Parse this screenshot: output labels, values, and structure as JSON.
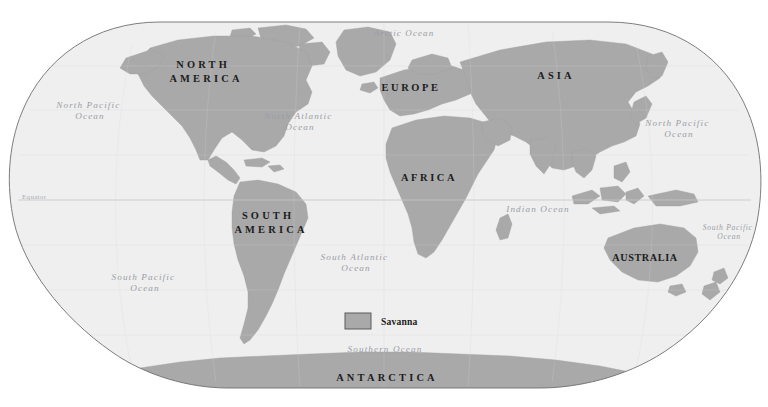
{
  "map": {
    "projection": "Robinson",
    "title_visible": false,
    "colors": {
      "background": "#ffffff",
      "ocean": "#efefef",
      "land": "#a9a9a9",
      "land_stroke": "#9d9d9d",
      "frame_stroke": "#6d6d6d",
      "antarctica": "#a9a9a9",
      "ocean_label": "#9a9ea6",
      "continent_label": "#1c1c1c",
      "graticule": "#cfcfcf",
      "legend_swatch": "#a9a9a9",
      "legend_swatch_border": "#5a5a5a"
    },
    "continents": [
      {
        "id": "north-america",
        "label": "NORTH AMERICA",
        "lines": [
          "NORTH",
          "AMERICA"
        ],
        "x": 206,
        "y": 69,
        "style": "wide"
      },
      {
        "id": "south-america",
        "label": "SOUTH AMERICA",
        "lines": [
          "SOUTH",
          "AMERICA"
        ],
        "x": 271,
        "y": 220,
        "style": "wide"
      },
      {
        "id": "europe",
        "label": "EUROPE",
        "lines": [
          "EUROPE"
        ],
        "x": 411,
        "y": 88,
        "style": "normal"
      },
      {
        "id": "africa",
        "label": "AFRICA",
        "lines": [
          "AFRICA"
        ],
        "x": 429,
        "y": 178,
        "style": "normal"
      },
      {
        "id": "asia",
        "label": "ASIA",
        "lines": [
          "ASIA"
        ],
        "x": 556,
        "y": 76,
        "style": "normal"
      },
      {
        "id": "australia",
        "label": "AUSTRALIA",
        "lines": [
          "AUSTRALIA"
        ],
        "x": 645,
        "y": 258,
        "style": "tight"
      },
      {
        "id": "antarctica",
        "label": "ANTARCTICA",
        "lines": [
          "ANTARCTICA"
        ],
        "x": 387,
        "y": 379,
        "style": "wide"
      }
    ],
    "oceans": [
      {
        "id": "arctic-ocean",
        "label": "Arctic Ocean",
        "lines": [
          "Arctic Ocean"
        ],
        "x": 404,
        "y": 36,
        "size": "arctic"
      },
      {
        "id": "north-pacific-ocean-west",
        "label": "North Pacific Ocean",
        "lines": [
          "North Pacific",
          "Ocean"
        ],
        "x": 90,
        "y": 110,
        "size": "normal"
      },
      {
        "id": "north-atlantic-ocean",
        "label": "North Atlantic Ocean",
        "lines": [
          "North Atlantic",
          "Ocean"
        ],
        "x": 300,
        "y": 120,
        "size": "normal"
      },
      {
        "id": "north-pacific-ocean-east",
        "label": "North Pacific Ocean",
        "lines": [
          "North Pacific",
          "Ocean"
        ],
        "x": 679,
        "y": 127,
        "size": "normal"
      },
      {
        "id": "south-pacific-ocean-west",
        "label": "South Pacific Ocean",
        "lines": [
          "South Pacific",
          "Ocean"
        ],
        "x": 145,
        "y": 282,
        "size": "normal"
      },
      {
        "id": "south-atlantic-ocean",
        "label": "South Atlantic Ocean",
        "lines": [
          "South Atlantic",
          "Ocean"
        ],
        "x": 356,
        "y": 261,
        "size": "normal"
      },
      {
        "id": "indian-ocean",
        "label": "Indian Ocean",
        "lines": [
          "Indian Ocean"
        ],
        "x": 538,
        "y": 212,
        "size": "normal"
      },
      {
        "id": "south-pacific-ocean-east",
        "label": "South Pacific Ocean",
        "lines": [
          "South Pacific",
          "Ocean"
        ],
        "x": 729,
        "y": 232,
        "size": "sm"
      },
      {
        "id": "southern-ocean",
        "label": "Southern Ocean",
        "lines": [
          "Southern Ocean"
        ],
        "x": 385,
        "y": 352,
        "size": "normal"
      }
    ],
    "equator": {
      "label": "Equator",
      "label_x": 22,
      "label_y": 199,
      "line_y": 200,
      "line_x1": 18,
      "line_x2": 751
    },
    "legend": {
      "items": [
        {
          "id": "savanna",
          "label": "Savanna",
          "swatch_color": "#a9a9a9",
          "swatch_border": "#5a5a5a"
        }
      ],
      "swatch_x": 345,
      "swatch_y": 313,
      "swatch_w": 26,
      "swatch_h": 16,
      "label_x": 381,
      "label_y": 325
    },
    "credit": {
      "label": "",
      "x": 384,
      "y": 403
    }
  }
}
